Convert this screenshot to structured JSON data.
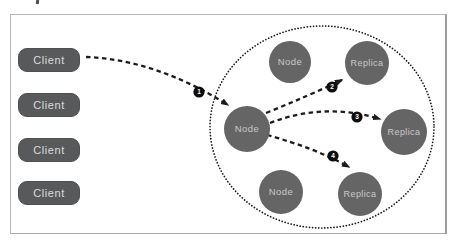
{
  "clients": [
    "Client",
    "Client",
    "Client",
    "Client"
  ],
  "cluster": {
    "nodes": [
      "Node",
      "Node",
      "Node"
    ],
    "replicas": [
      "Replica",
      "Replica",
      "Replica"
    ]
  },
  "steps": [
    "1",
    "2",
    "3",
    "4"
  ],
  "colors": {
    "client_fill": "#58595a",
    "shape_fill": "#656565",
    "shape_text": "#c9c9c9",
    "client_text": "#dcdcdc",
    "arrow": "#1c1c1c",
    "cluster_ring": "#1a1a1a",
    "badge_fill": "#0d0d0d",
    "badge_text": "#ffffff",
    "frame_border": "#b6b6b6"
  }
}
